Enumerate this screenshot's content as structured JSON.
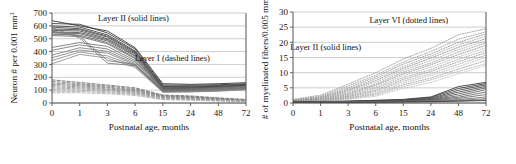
{
  "figure": {
    "background": "#ffffff",
    "panel_count": 2
  },
  "chart_data": [
    {
      "type": "line",
      "panel": "left",
      "title": "",
      "xlabel": "Postnatal age, months",
      "ylabel": "Neuron # per 0.001 mm³",
      "ylabel_main": "Neuron # per 0.001 mm",
      "ylabel_exponent": "3",
      "categories": [
        "0",
        "1",
        "3",
        "6",
        "15",
        "24",
        "48",
        "72"
      ],
      "x": [
        0,
        1,
        3,
        6,
        15,
        24,
        48,
        72
      ],
      "ylim": [
        0,
        700
      ],
      "yticks": [
        0,
        100,
        200,
        300,
        400,
        500,
        600,
        700
      ],
      "grid": true,
      "grid_orientation": "horizontal",
      "annotations": [
        {
          "text": "Layer II (solid lines)",
          "x_frac": 0.42,
          "y_value": 640
        },
        {
          "text": "Layer I (dashed lines)",
          "x_frac": 0.62,
          "y_value": 330
        }
      ],
      "series": [
        {
          "name": "Layer II case 1",
          "group": "Layer II",
          "style": "solid",
          "color": "#2b2b2b",
          "values": [
            640,
            600,
            560,
            430,
            150,
            145,
            150,
            158
          ]
        },
        {
          "name": "Layer II case 2",
          "group": "Layer II",
          "style": "solid",
          "color": "#323232",
          "values": [
            618,
            612,
            545,
            420,
            140,
            138,
            142,
            150
          ]
        },
        {
          "name": "Layer II case 3",
          "group": "Layer II",
          "style": "solid",
          "color": "#3a3a3a",
          "values": [
            600,
            590,
            530,
            405,
            132,
            130,
            136,
            145
          ]
        },
        {
          "name": "Layer II case 4",
          "group": "Layer II",
          "style": "solid",
          "color": "#404040",
          "values": [
            590,
            578,
            520,
            398,
            128,
            126,
            130,
            140
          ]
        },
        {
          "name": "Layer II case 5",
          "group": "Layer II",
          "style": "solid",
          "color": "#464646",
          "values": [
            575,
            570,
            512,
            390,
            122,
            122,
            128,
            138
          ]
        },
        {
          "name": "Layer II case 6",
          "group": "Layer II",
          "style": "solid",
          "color": "#4c4c4c",
          "values": [
            565,
            560,
            500,
            382,
            118,
            118,
            124,
            134
          ]
        },
        {
          "name": "Layer II case 7",
          "group": "Layer II",
          "style": "solid",
          "color": "#535353",
          "values": [
            552,
            548,
            492,
            372,
            112,
            114,
            120,
            130
          ]
        },
        {
          "name": "Layer II case 8",
          "group": "Layer II",
          "style": "solid",
          "color": "#5a5a5a",
          "values": [
            545,
            540,
            482,
            364,
            108,
            110,
            116,
            126
          ]
        },
        {
          "name": "Layer II case 9",
          "group": "Layer II",
          "style": "solid",
          "color": "#606060",
          "values": [
            535,
            528,
            470,
            352,
            104,
            106,
            112,
            122
          ]
        },
        {
          "name": "Layer II case 10",
          "group": "Layer II",
          "style": "solid",
          "color": "#666666",
          "values": [
            524,
            518,
            460,
            344,
            100,
            102,
            108,
            118
          ]
        },
        {
          "name": "Layer II case 11",
          "group": "Layer II",
          "style": "solid",
          "color": "#6d6d6d",
          "values": [
            432,
            470,
            440,
            330,
            96,
            98,
            104,
            114
          ]
        },
        {
          "name": "Layer II case 12",
          "group": "Layer II",
          "style": "solid",
          "color": "#737373",
          "values": [
            410,
            452,
            420,
            318,
            92,
            95,
            100,
            110
          ]
        },
        {
          "name": "Layer II case 13",
          "group": "Layer II",
          "style": "solid",
          "color": "#797979",
          "values": [
            372,
            430,
            402,
            306,
            90,
            92,
            98,
            108
          ]
        },
        {
          "name": "Layer II case 14",
          "group": "Layer II",
          "style": "solid",
          "color": "#808080",
          "values": [
            352,
            412,
            388,
            296,
            88,
            90,
            96,
            106
          ]
        },
        {
          "name": "Layer II case 15",
          "group": "Layer II",
          "style": "solid",
          "color": "#868686",
          "values": [
            330,
            396,
            366,
            288,
            86,
            88,
            94,
            104
          ]
        },
        {
          "name": "Layer II case 16",
          "group": "Layer II",
          "style": "solid",
          "color": "#8c8c8c",
          "values": [
            305,
            378,
            350,
            276,
            84,
            86,
            92,
            102
          ]
        },
        {
          "name": "Layer II case 17",
          "group": "Layer II",
          "style": "solid",
          "color": "#727272",
          "values": [
            560,
            520,
            330,
            300,
            95,
            100,
            118,
            130
          ]
        },
        {
          "name": "Layer II case 18",
          "group": "Layer II",
          "style": "solid",
          "color": "#7a7a7a",
          "values": [
            585,
            505,
            310,
            290,
            90,
            96,
            110,
            124
          ]
        },
        {
          "name": "Layer I case 1",
          "group": "Layer I",
          "style": "dashed",
          "color": "#6e6e6e",
          "values": [
            180,
            160,
            140,
            118,
            62,
            55,
            40,
            28
          ]
        },
        {
          "name": "Layer I case 2",
          "group": "Layer I",
          "style": "dashed",
          "color": "#767676",
          "values": [
            168,
            150,
            132,
            110,
            58,
            50,
            36,
            24
          ]
        },
        {
          "name": "Layer I case 3",
          "group": "Layer I",
          "style": "dashed",
          "color": "#7d7d7d",
          "values": [
            156,
            142,
            124,
            102,
            54,
            46,
            32,
            22
          ]
        },
        {
          "name": "Layer I case 4",
          "group": "Layer I",
          "style": "dashed",
          "color": "#848484",
          "values": [
            146,
            134,
            118,
            96,
            50,
            42,
            30,
            20
          ]
        },
        {
          "name": "Layer I case 5",
          "group": "Layer I",
          "style": "dashed",
          "color": "#8b8b8b",
          "values": [
            136,
            126,
            110,
            90,
            46,
            38,
            27,
            18
          ]
        },
        {
          "name": "Layer I case 6",
          "group": "Layer I",
          "style": "dashed",
          "color": "#929292",
          "values": [
            126,
            118,
            104,
            84,
            42,
            35,
            25,
            16
          ]
        },
        {
          "name": "Layer I case 7",
          "group": "Layer I",
          "style": "dashed",
          "color": "#999999",
          "values": [
            116,
            110,
            96,
            78,
            38,
            32,
            22,
            14
          ]
        },
        {
          "name": "Layer I case 8",
          "group": "Layer I",
          "style": "dashed",
          "color": "#a0a0a0",
          "values": [
            104,
            100,
            88,
            72,
            34,
            28,
            20,
            12
          ]
        },
        {
          "name": "Layer I case 9",
          "group": "Layer I",
          "style": "dashed",
          "color": "#a8a8a8",
          "values": [
            92,
            90,
            80,
            66,
            30,
            25,
            18,
            11
          ]
        },
        {
          "name": "Layer I case 10",
          "group": "Layer I",
          "style": "dashed",
          "color": "#b0b0b0",
          "values": [
            80,
            80,
            72,
            58,
            26,
            22,
            16,
            10
          ]
        }
      ]
    },
    {
      "type": "line",
      "panel": "right",
      "title": "",
      "xlabel": "Postnatal age, months",
      "ylabel": "# of myelinated fibers/0.005 mm²",
      "ylabel_main": "# of myelinated fibers/0.005 mm",
      "ylabel_exponent": "2",
      "categories": [
        "0",
        "1",
        "3",
        "6",
        "15",
        "24",
        "48",
        "72"
      ],
      "x": [
        0,
        1,
        3,
        6,
        15,
        24,
        48,
        72
      ],
      "ylim": [
        0,
        30
      ],
      "yticks": [
        0,
        5,
        10,
        15,
        20,
        25,
        30
      ],
      "grid": true,
      "grid_orientation": "horizontal",
      "annotations": [
        {
          "text": "Layer VI (dotted lines)",
          "x_frac": 0.6,
          "y_value": 26.5
        },
        {
          "text": "Layer II (solid lines)",
          "x_frac": 0.17,
          "y_value": 17.5
        }
      ],
      "series": [
        {
          "name": "Layer VI case 1",
          "group": "Layer VI",
          "style": "dotted",
          "color": "#909090",
          "values": [
            1.2,
            2.6,
            6.2,
            10.0,
            14.5,
            18.0,
            22.5,
            24.5
          ]
        },
        {
          "name": "Layer VI case 2",
          "group": "Layer VI",
          "style": "dotted",
          "color": "#989898",
          "values": [
            1.0,
            2.2,
            5.6,
            9.2,
            13.5,
            17.0,
            21.0,
            23.5
          ]
        },
        {
          "name": "Layer VI case 3",
          "group": "Layer VI",
          "style": "dotted",
          "color": "#8a8a8a",
          "values": [
            0.9,
            2.0,
            5.0,
            8.6,
            12.8,
            16.2,
            20.0,
            22.8
          ]
        },
        {
          "name": "Layer VI case 4",
          "group": "Layer VI",
          "style": "dotted",
          "color": "#a0a0a0",
          "values": [
            0.8,
            1.8,
            4.5,
            8.0,
            12.0,
            15.5,
            19.2,
            22.0
          ]
        },
        {
          "name": "Layer VI case 5",
          "group": "Layer VI",
          "style": "dotted",
          "color": "#7e7e7e",
          "values": [
            0.7,
            1.6,
            4.2,
            7.4,
            11.4,
            14.8,
            18.4,
            21.2
          ]
        },
        {
          "name": "Layer VI case 6",
          "group": "Layer VI",
          "style": "dotted",
          "color": "#a8a8a8",
          "values": [
            0.6,
            1.4,
            3.8,
            6.8,
            10.8,
            14.0,
            17.6,
            20.5
          ]
        },
        {
          "name": "Layer VI case 7",
          "group": "Layer VI",
          "style": "dotted",
          "color": "#949494",
          "values": [
            0.6,
            1.3,
            3.4,
            6.2,
            10.2,
            13.2,
            16.8,
            19.8
          ]
        },
        {
          "name": "Layer VI case 8",
          "group": "Layer VI",
          "style": "dotted",
          "color": "#868686",
          "values": [
            0.5,
            1.2,
            3.0,
            5.8,
            9.6,
            12.6,
            16.0,
            19.0
          ]
        },
        {
          "name": "Layer VI case 9",
          "group": "Layer VI",
          "style": "dotted",
          "color": "#b0b0b0",
          "values": [
            0.5,
            1.0,
            2.8,
            5.2,
            9.0,
            11.8,
            15.2,
            18.2
          ]
        },
        {
          "name": "Layer VI case 10",
          "group": "Layer VI",
          "style": "dotted",
          "color": "#9c9c9c",
          "values": [
            0.4,
            0.9,
            2.5,
            4.8,
            8.4,
            11.0,
            14.4,
            17.4
          ]
        },
        {
          "name": "Layer VI case 11",
          "group": "Layer VI",
          "style": "dotted",
          "color": "#8e8e8e",
          "values": [
            0.4,
            0.8,
            2.2,
            4.2,
            7.8,
            10.4,
            13.6,
            16.6
          ]
        },
        {
          "name": "Layer VI case 12",
          "group": "Layer VI",
          "style": "dotted",
          "color": "#a4a4a4",
          "values": [
            0.3,
            0.7,
            2.0,
            3.8,
            7.2,
            9.6,
            12.8,
            15.8
          ]
        },
        {
          "name": "Layer VI case 13",
          "group": "Layer VI",
          "style": "dotted",
          "color": "#b8b8b8",
          "values": [
            0.3,
            0.6,
            1.8,
            3.4,
            6.6,
            9.0,
            12.0,
            15.0
          ]
        },
        {
          "name": "Layer VI case 14",
          "group": "Layer VI",
          "style": "dotted",
          "color": "#969696",
          "values": [
            0.3,
            0.6,
            1.6,
            3.0,
            6.0,
            8.2,
            11.2,
            14.0
          ]
        },
        {
          "name": "Layer VI case 15",
          "group": "Layer VI",
          "style": "dotted",
          "color": "#ababab",
          "values": [
            0.2,
            0.5,
            1.4,
            2.6,
            5.4,
            7.6,
            10.4,
            13.0
          ]
        },
        {
          "name": "Layer VI case 16",
          "group": "Layer VI",
          "style": "dotted",
          "color": "#bfbfbf",
          "values": [
            0.2,
            0.4,
            1.2,
            2.2,
            4.8,
            6.8,
            9.6,
            12.4
          ]
        },
        {
          "name": "Layer II case 1",
          "group": "Layer II",
          "style": "solid",
          "color": "#2e2e2e",
          "values": [
            0.5,
            0.5,
            0.6,
            0.9,
            1.2,
            2.0,
            5.4,
            6.8
          ]
        },
        {
          "name": "Layer II case 2",
          "group": "Layer II",
          "style": "solid",
          "color": "#373737",
          "values": [
            0.4,
            0.4,
            0.6,
            0.8,
            1.0,
            1.8,
            4.8,
            6.4
          ]
        },
        {
          "name": "Layer II case 3",
          "group": "Layer II",
          "style": "solid",
          "color": "#3f3f3f",
          "values": [
            0.4,
            0.4,
            0.5,
            0.7,
            0.9,
            1.5,
            4.2,
            6.0
          ]
        },
        {
          "name": "Layer II case 4",
          "group": "Layer II",
          "style": "solid",
          "color": "#474747",
          "values": [
            0.3,
            0.4,
            0.5,
            0.7,
            0.8,
            1.3,
            3.6,
            5.5
          ]
        },
        {
          "name": "Layer II case 5",
          "group": "Layer II",
          "style": "solid",
          "color": "#4f4f4f",
          "values": [
            0.3,
            0.3,
            0.4,
            0.6,
            0.8,
            1.1,
            3.0,
            5.0
          ]
        },
        {
          "name": "Layer II case 6",
          "group": "Layer II",
          "style": "solid",
          "color": "#575757",
          "values": [
            0.3,
            0.3,
            0.4,
            0.5,
            0.7,
            1.0,
            2.4,
            4.4
          ]
        },
        {
          "name": "Layer II case 7",
          "group": "Layer II",
          "style": "solid",
          "color": "#5f5f5f",
          "values": [
            0.2,
            0.3,
            0.4,
            0.5,
            0.6,
            0.9,
            1.9,
            3.6
          ]
        },
        {
          "name": "Layer II case 8",
          "group": "Layer II",
          "style": "solid",
          "color": "#676767",
          "values": [
            0.2,
            0.2,
            0.3,
            0.4,
            0.6,
            0.8,
            1.5,
            2.8
          ]
        },
        {
          "name": "Layer II case 9",
          "group": "Layer II",
          "style": "solid",
          "color": "#6f6f6f",
          "values": [
            0.2,
            0.2,
            0.3,
            0.4,
            0.5,
            0.7,
            1.1,
            2.0
          ]
        },
        {
          "name": "Layer II case 10",
          "group": "Layer II",
          "style": "solid",
          "color": "#777777",
          "values": [
            0.1,
            0.2,
            0.2,
            0.3,
            0.4,
            0.6,
            0.9,
            1.4
          ]
        },
        {
          "name": "Layer II case 11",
          "group": "Layer II",
          "style": "solid",
          "color": "#555555",
          "values": [
            0.1,
            0.1,
            0.2,
            0.3,
            0.4,
            0.5,
            0.7,
            1.0
          ]
        },
        {
          "name": "Layer II case 12",
          "group": "Layer II",
          "style": "solid",
          "color": "#444444",
          "values": [
            0.1,
            0.1,
            0.2,
            0.2,
            0.3,
            0.4,
            0.6,
            0.8
          ]
        }
      ]
    }
  ]
}
